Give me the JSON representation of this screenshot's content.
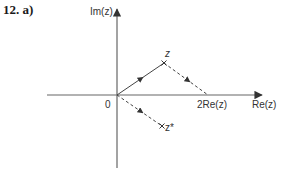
{
  "question_label": "12.  a)",
  "axes": {
    "x_label": "Re(z)",
    "y_label": "Im(z)",
    "origin_label": "0"
  },
  "points": {
    "z": "z",
    "z_conjugate": "z*",
    "two_re_z": "2Re(z)"
  },
  "colors": {
    "axis": "#666666",
    "vector": "#444444",
    "text": "#333333"
  }
}
